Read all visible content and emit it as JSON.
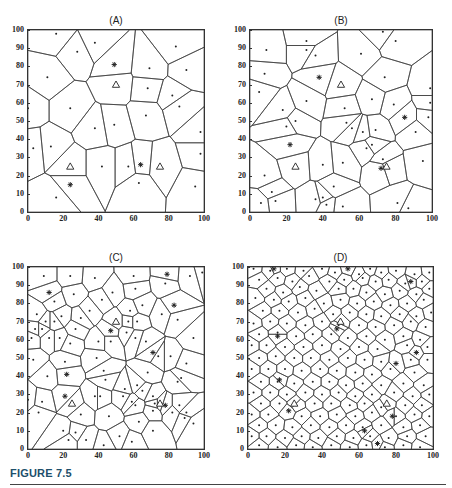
{
  "figure": {
    "label": "FIGURE 7.5",
    "accent_color": "#1d4f6b"
  },
  "chart_data": [
    {
      "type": "scatter",
      "subtype": "voronoi",
      "title": "(A)",
      "xlim": [
        0,
        100
      ],
      "ylim": [
        0,
        100
      ],
      "xticks": [
        "0",
        "20",
        "40",
        "60",
        "80",
        "100"
      ],
      "yticks": [
        "0",
        "10",
        "20",
        "30",
        "40",
        "50",
        "60",
        "70",
        "80",
        "90",
        "100"
      ],
      "grid": false,
      "sites": [
        [
          16,
          98
        ],
        [
          38,
          93
        ],
        [
          28,
          88
        ],
        [
          84,
          91
        ],
        [
          69,
          79
        ],
        [
          90,
          78
        ],
        [
          11,
          74
        ],
        [
          68,
          68
        ],
        [
          82,
          64
        ],
        [
          86,
          58
        ],
        [
          24,
          57
        ],
        [
          67,
          53
        ],
        [
          38,
          46
        ],
        [
          49,
          48
        ],
        [
          98,
          44
        ],
        [
          3,
          35
        ],
        [
          13,
          36
        ],
        [
          98,
          32
        ],
        [
          42,
          25
        ],
        [
          57,
          25
        ],
        [
          16,
          8
        ],
        [
          63,
          16
        ],
        [
          95,
          14
        ],
        [
          0,
          57
        ]
      ],
      "asterisks": [
        [
          49,
          81
        ],
        [
          64,
          26
        ],
        [
          24,
          15
        ]
      ],
      "triangles": [
        [
          50,
          70
        ],
        [
          24,
          25
        ],
        [
          75,
          25
        ]
      ]
    },
    {
      "type": "scatter",
      "subtype": "voronoi",
      "title": "(B)",
      "xlim": [
        0,
        100
      ],
      "ylim": [
        0,
        100
      ],
      "xticks": [
        "0",
        "20",
        "40",
        "60",
        "80",
        "100"
      ],
      "yticks": [
        "0",
        "10",
        "20",
        "30",
        "40",
        "50",
        "60",
        "70",
        "80",
        "90",
        "100"
      ],
      "grid": false,
      "sites": [
        [
          73,
          99
        ],
        [
          80,
          94
        ],
        [
          31,
          94
        ],
        [
          9,
          89
        ],
        [
          31,
          89
        ],
        [
          36,
          86
        ],
        [
          61,
          87
        ],
        [
          8,
          76
        ],
        [
          74,
          74
        ],
        [
          5,
          66
        ],
        [
          99,
          68
        ],
        [
          31,
          61
        ],
        [
          67,
          62
        ],
        [
          79,
          59
        ],
        [
          18,
          56
        ],
        [
          52,
          57
        ],
        [
          99,
          60
        ],
        [
          98,
          52
        ],
        [
          25,
          50
        ],
        [
          53,
          49
        ],
        [
          20,
          47
        ],
        [
          56,
          46
        ],
        [
          62,
          44
        ],
        [
          69,
          45
        ],
        [
          91,
          44
        ],
        [
          64,
          35
        ],
        [
          67,
          37
        ],
        [
          73,
          29
        ],
        [
          95,
          28
        ],
        [
          40,
          26
        ],
        [
          51,
          27
        ],
        [
          8,
          20
        ],
        [
          46,
          14
        ],
        [
          12,
          11
        ],
        [
          6,
          5
        ],
        [
          14,
          6
        ],
        [
          36,
          7
        ],
        [
          40,
          8
        ],
        [
          42,
          4
        ],
        [
          51,
          3
        ],
        [
          81,
          5
        ],
        [
          87,
          2
        ]
      ],
      "asterisks": [
        [
          38,
          74
        ],
        [
          85,
          52
        ],
        [
          22,
          37
        ],
        [
          72,
          24
        ]
      ],
      "triangles": [
        [
          50,
          70
        ],
        [
          25,
          25
        ],
        [
          75,
          25
        ]
      ]
    },
    {
      "type": "scatter",
      "subtype": "voronoi",
      "title": "(C)",
      "xlim": [
        0,
        100
      ],
      "ylim": [
        0,
        100
      ],
      "xticks": [
        "0",
        "20",
        "40",
        "60",
        "80",
        "100"
      ],
      "yticks": [
        "0",
        "10",
        "20",
        "30",
        "40",
        "50",
        "60",
        "70",
        "80",
        "90",
        "100"
      ],
      "grid": false,
      "sites": [
        [
          9,
          95
        ],
        [
          24,
          95
        ],
        [
          38,
          94
        ],
        [
          60,
          95
        ],
        [
          92,
          95
        ],
        [
          99,
          97
        ],
        [
          26,
          85
        ],
        [
          48,
          86
        ],
        [
          61,
          88
        ],
        [
          78,
          91
        ],
        [
          15,
          81
        ],
        [
          42,
          82
        ],
        [
          65,
          79
        ],
        [
          5,
          74
        ],
        [
          19,
          73
        ],
        [
          35,
          76
        ],
        [
          58,
          76
        ],
        [
          76,
          74
        ],
        [
          10,
          70
        ],
        [
          30,
          72
        ],
        [
          57,
          70
        ],
        [
          62,
          70
        ],
        [
          85,
          71
        ],
        [
          4,
          66
        ],
        [
          8,
          66
        ],
        [
          15,
          70
        ],
        [
          27,
          66
        ],
        [
          56,
          64
        ],
        [
          2,
          61
        ],
        [
          12,
          61
        ],
        [
          18,
          61
        ],
        [
          24,
          58
        ],
        [
          40,
          59
        ],
        [
          47,
          59
        ],
        [
          61,
          61
        ],
        [
          67,
          59
        ],
        [
          94,
          61
        ],
        [
          3,
          49
        ],
        [
          21,
          48
        ],
        [
          39,
          50
        ],
        [
          74,
          51
        ],
        [
          81,
          51
        ],
        [
          90,
          47
        ],
        [
          11,
          40
        ],
        [
          43,
          43
        ],
        [
          68,
          42
        ],
        [
          85,
          37
        ],
        [
          87,
          39
        ],
        [
          44,
          38
        ],
        [
          62,
          35
        ],
        [
          55,
          33
        ],
        [
          65,
          32
        ],
        [
          71,
          29
        ],
        [
          0,
          27
        ],
        [
          8,
          26
        ],
        [
          38,
          29
        ],
        [
          41,
          29
        ],
        [
          54,
          29
        ],
        [
          61,
          24
        ],
        [
          59,
          26
        ],
        [
          72,
          25
        ],
        [
          86,
          24
        ],
        [
          90,
          20
        ],
        [
          6,
          20
        ],
        [
          30,
          19
        ],
        [
          46,
          18
        ],
        [
          71,
          21
        ],
        [
          82,
          20
        ],
        [
          89,
          17
        ],
        [
          94,
          14
        ],
        [
          20,
          10
        ],
        [
          27,
          9
        ],
        [
          63,
          15
        ],
        [
          71,
          10
        ],
        [
          23,
          5
        ],
        [
          33,
          5
        ],
        [
          52,
          7
        ],
        [
          59,
          4
        ],
        [
          43,
          2
        ]
      ],
      "asterisks": [
        [
          79,
          96
        ],
        [
          12,
          86
        ],
        [
          83,
          79
        ],
        [
          47,
          65
        ],
        [
          71,
          53
        ],
        [
          22,
          41
        ],
        [
          21,
          29
        ],
        [
          78,
          24
        ]
      ],
      "triangles": [
        [
          50,
          70
        ],
        [
          25,
          25
        ],
        [
          75,
          25
        ]
      ]
    },
    {
      "type": "scatter",
      "subtype": "voronoi",
      "title": "(D)",
      "xlim": [
        0,
        100
      ],
      "ylim": [
        0,
        100
      ],
      "xticks": [
        "0",
        "20",
        "40",
        "60",
        "80",
        "100"
      ],
      "yticks": [
        "0",
        "10",
        "20",
        "30",
        "40",
        "50",
        "60",
        "70",
        "80",
        "90",
        "100"
      ],
      "grid": false,
      "sites": [
        [
          3,
          99
        ],
        [
          12,
          98
        ],
        [
          21,
          99
        ],
        [
          30,
          98
        ],
        [
          40,
          99
        ],
        [
          47,
          97
        ],
        [
          60,
          96
        ],
        [
          66,
          99
        ],
        [
          72,
          97
        ],
        [
          80,
          98
        ],
        [
          90,
          96
        ],
        [
          98,
          97
        ],
        [
          6,
          93
        ],
        [
          16,
          94
        ],
        [
          24,
          92
        ],
        [
          33,
          95
        ],
        [
          44,
          92
        ],
        [
          52,
          93
        ],
        [
          62,
          94
        ],
        [
          69,
          92
        ],
        [
          76,
          93
        ],
        [
          85,
          91
        ],
        [
          94,
          92
        ],
        [
          10,
          88
        ],
        [
          19,
          86
        ],
        [
          28,
          89
        ],
        [
          37,
          87
        ],
        [
          49,
          88
        ],
        [
          57,
          88
        ],
        [
          64,
          86
        ],
        [
          74,
          85
        ],
        [
          82,
          87
        ],
        [
          91,
          85
        ],
        [
          98,
          88
        ],
        [
          4,
          83
        ],
        [
          14,
          82
        ],
        [
          22,
          81
        ],
        [
          31,
          83
        ],
        [
          41,
          80
        ],
        [
          50,
          82
        ],
        [
          59,
          80
        ],
        [
          68,
          81
        ],
        [
          77,
          79
        ],
        [
          86,
          80
        ],
        [
          95,
          82
        ],
        [
          8,
          76
        ],
        [
          17,
          76
        ],
        [
          27,
          75
        ],
        [
          36,
          77
        ],
        [
          46,
          74
        ],
        [
          55,
          75
        ],
        [
          64,
          74
        ],
        [
          72,
          73
        ],
        [
          82,
          74
        ],
        [
          91,
          73
        ],
        [
          99,
          75
        ],
        [
          3,
          69
        ],
        [
          12,
          70
        ],
        [
          21,
          69
        ],
        [
          31,
          68
        ],
        [
          40,
          70
        ],
        [
          49,
          68
        ],
        [
          60,
          68
        ],
        [
          69,
          67
        ],
        [
          79,
          68
        ],
        [
          88,
          70
        ],
        [
          96,
          67
        ],
        [
          6,
          63
        ],
        [
          16,
          64
        ],
        [
          26,
          62
        ],
        [
          35,
          63
        ],
        [
          45,
          63
        ],
        [
          54,
          61
        ],
        [
          64,
          62
        ],
        [
          74,
          60
        ],
        [
          84,
          62
        ],
        [
          93,
          60
        ],
        [
          2,
          57
        ],
        [
          10,
          57
        ],
        [
          20,
          56
        ],
        [
          30,
          56
        ],
        [
          40,
          57
        ],
        [
          50,
          55
        ],
        [
          60,
          56
        ],
        [
          70,
          55
        ],
        [
          86,
          57
        ],
        [
          97,
          56
        ],
        [
          6,
          50
        ],
        [
          15,
          51
        ],
        [
          25,
          50
        ],
        [
          34,
          50
        ],
        [
          44,
          49
        ],
        [
          54,
          50
        ],
        [
          63,
          49
        ],
        [
          72,
          48
        ],
        [
          88,
          49
        ],
        [
          97,
          49
        ],
        [
          2,
          44
        ],
        [
          11,
          44
        ],
        [
          20,
          44
        ],
        [
          29,
          43
        ],
        [
          39,
          44
        ],
        [
          48,
          43
        ],
        [
          58,
          42
        ],
        [
          67,
          41
        ],
        [
          77,
          44
        ],
        [
          90,
          42
        ],
        [
          7,
          37
        ],
        [
          16,
          37
        ],
        [
          25,
          36
        ],
        [
          35,
          37
        ],
        [
          44,
          37
        ],
        [
          53,
          35
        ],
        [
          62,
          36
        ],
        [
          72,
          35
        ],
        [
          84,
          36
        ],
        [
          95,
          35
        ],
        [
          3,
          31
        ],
        [
          12,
          31
        ],
        [
          21,
          30
        ],
        [
          31,
          31
        ],
        [
          40,
          30
        ],
        [
          49,
          31
        ],
        [
          58,
          29
        ],
        [
          67,
          30
        ],
        [
          79,
          31
        ],
        [
          89,
          29
        ],
        [
          98,
          30
        ],
        [
          7,
          25
        ],
        [
          17,
          25
        ],
        [
          26,
          24
        ],
        [
          36,
          25
        ],
        [
          45,
          25
        ],
        [
          55,
          24
        ],
        [
          63,
          25
        ],
        [
          72,
          23
        ],
        [
          85,
          24
        ],
        [
          94,
          24
        ],
        [
          2,
          19
        ],
        [
          11,
          19
        ],
        [
          29,
          18
        ],
        [
          39,
          18
        ],
        [
          48,
          19
        ],
        [
          58,
          18
        ],
        [
          67,
          20
        ],
        [
          80,
          18
        ],
        [
          90,
          19
        ],
        [
          98,
          18
        ],
        [
          6,
          13
        ],
        [
          15,
          13
        ],
        [
          24,
          12
        ],
        [
          34,
          13
        ],
        [
          44,
          12
        ],
        [
          53,
          13
        ],
        [
          62,
          12
        ],
        [
          72,
          13
        ],
        [
          84,
          12
        ],
        [
          93,
          13
        ],
        [
          2,
          7
        ],
        [
          10,
          7
        ],
        [
          20,
          6
        ],
        [
          29,
          7
        ],
        [
          38,
          6
        ],
        [
          48,
          7
        ],
        [
          57,
          6
        ],
        [
          66,
          7
        ],
        [
          76,
          6
        ],
        [
          86,
          7
        ],
        [
          96,
          7
        ],
        [
          6,
          2
        ],
        [
          16,
          1
        ],
        [
          26,
          2
        ],
        [
          35,
          1
        ],
        [
          45,
          2
        ],
        [
          55,
          1
        ],
        [
          64,
          2
        ],
        [
          74,
          1
        ],
        [
          84,
          2
        ],
        [
          93,
          1
        ]
      ],
      "asterisks": [
        [
          14,
          99
        ],
        [
          54,
          99
        ],
        [
          88,
          92
        ],
        [
          48,
          66
        ],
        [
          16,
          62
        ],
        [
          91,
          53
        ],
        [
          80,
          47
        ],
        [
          17,
          38
        ],
        [
          22,
          21
        ],
        [
          78,
          18
        ],
        [
          63,
          10
        ],
        [
          70,
          3
        ]
      ],
      "triangles": [
        [
          50,
          70
        ],
        [
          25,
          25
        ],
        [
          75,
          25
        ]
      ]
    }
  ],
  "style": {
    "edge_color": "#3a3a3a",
    "site_color": "#222222",
    "frame_color": "#333333"
  }
}
